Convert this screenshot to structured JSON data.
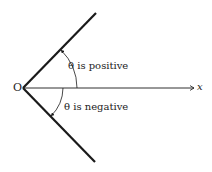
{
  "diagram": {
    "origin_label": "O",
    "axis_label": "x",
    "positive_label": "θ is positive",
    "negative_label": "θ is negative",
    "colors": {
      "line": "#1a1a1a",
      "text": "#222222",
      "background": "#ffffff"
    }
  }
}
